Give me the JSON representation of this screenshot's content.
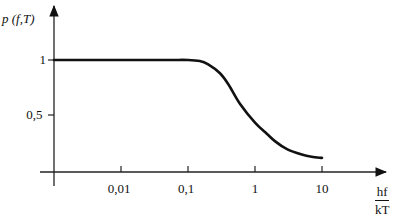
{
  "chart_data": {
    "type": "line",
    "title": "",
    "xlabel": {
      "numerator": "hf",
      "denominator": "kT"
    },
    "ylabel": "p (f,T)",
    "x_scale": "log",
    "xlim": [
      0.001,
      30
    ],
    "ylim": [
      0,
      1.2
    ],
    "x_ticks": [
      {
        "value": 0.01,
        "label": "0,01"
      },
      {
        "value": 0.1,
        "label": "0,1"
      },
      {
        "value": 1,
        "label": "1"
      },
      {
        "value": 10,
        "label": "10"
      }
    ],
    "y_ticks": [
      {
        "value": 1,
        "label": "1"
      },
      {
        "value": 0.5,
        "label": "0,5"
      }
    ],
    "grid": false,
    "legend": null,
    "series": [
      {
        "name": "p(f,T)",
        "x": [
          0.001,
          0.01,
          0.05,
          0.1,
          0.15,
          0.2,
          0.3,
          0.4,
          0.6,
          1,
          1.5,
          2,
          3,
          5,
          7,
          10
        ],
        "y": [
          1.0,
          1.0,
          1.0,
          1.0,
          0.99,
          0.96,
          0.88,
          0.78,
          0.6,
          0.43,
          0.33,
          0.26,
          0.19,
          0.14,
          0.12,
          0.11
        ]
      }
    ],
    "color": "#111111"
  }
}
